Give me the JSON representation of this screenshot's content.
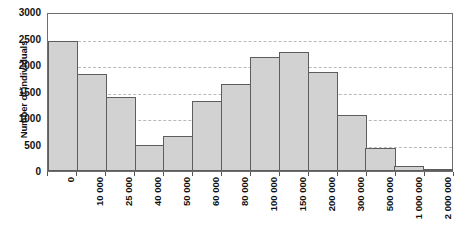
{
  "chart_data": {
    "type": "bar",
    "title": "",
    "subtitle": "",
    "xlabel": "",
    "ylabel": "Number of individuals",
    "categories": [
      "0",
      "10 000",
      "25 000",
      "40 000",
      "50 000",
      "60 000",
      "80 000",
      "100 000",
      "150 000",
      "200 000",
      "300 000",
      "500 000",
      "1 000 000",
      "2 000 000"
    ],
    "values": [
      2450,
      1830,
      1390,
      490,
      670,
      1320,
      1650,
      2160,
      2240,
      1870,
      1060,
      440,
      100,
      40
    ],
    "ylim": [
      0,
      3000
    ],
    "yticks": [
      0,
      500,
      1000,
      1500,
      2000,
      2500,
      3000
    ],
    "ytick_labels": [
      "0",
      "500",
      "1000",
      "1500",
      "2000",
      "2500",
      "3000"
    ],
    "grid": true,
    "grid_axis": "y",
    "legend": false,
    "legend_position": "none",
    "bar_fill_color": "#d2d2d2",
    "bar_edge_color": "#5d5d5d",
    "gridline_color": "#b9b9b9",
    "frame_color": "#6e6e6e"
  },
  "axes": {
    "y_title": "Number of individuals"
  },
  "caption": {
    "text": ""
  }
}
